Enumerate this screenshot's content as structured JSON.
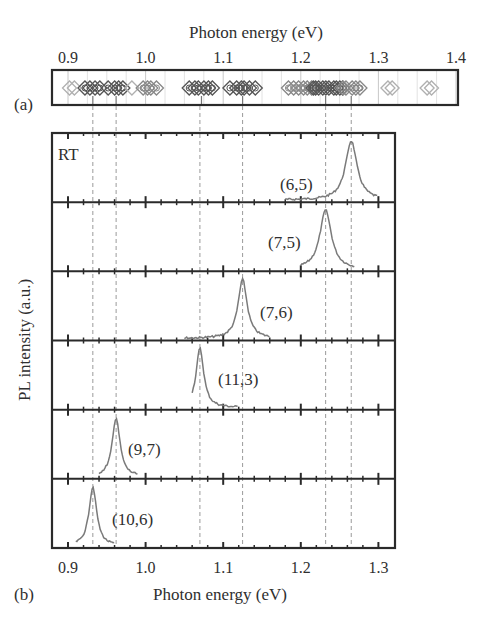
{
  "chart_data": [
    {
      "panel": "(a)",
      "type": "scatter",
      "title": "",
      "xlabel": "Photon energy (eV)",
      "xlabel_position": "top",
      "xlim": [
        0.9,
        1.4
      ],
      "xticks": [
        "0.9",
        "1.0",
        "1.1",
        "1.2",
        "1.3",
        "1.4"
      ],
      "marker": "open-diamond",
      "grid": "vertical minor lines",
      "clusters": [
        {
          "center": 0.905,
          "count": 2,
          "density": "light"
        },
        {
          "center": 0.932,
          "count": 4,
          "density": "dark"
        },
        {
          "center": 0.962,
          "count": 4,
          "density": "dark"
        },
        {
          "center": 0.983,
          "count": 1,
          "density": "light"
        },
        {
          "center": 1.005,
          "count": 4,
          "density": "medium"
        },
        {
          "center": 1.072,
          "count": 6,
          "density": "dark"
        },
        {
          "center": 1.125,
          "count": 6,
          "density": "dark"
        },
        {
          "center": 1.2,
          "count": 6,
          "density": "medium"
        },
        {
          "center": 1.235,
          "count": 10,
          "density": "dark"
        },
        {
          "center": 1.265,
          "count": 5,
          "density": "medium"
        },
        {
          "center": 1.315,
          "count": 2,
          "density": "light"
        },
        {
          "center": 1.365,
          "count": 2,
          "density": "light"
        }
      ],
      "arrows_at": [
        0.932,
        0.962,
        1.072,
        1.125,
        1.232,
        1.265
      ]
    },
    {
      "panel": "(b)",
      "type": "line",
      "title": "",
      "annotation": "RT",
      "xlabel": "Photon energy (eV)",
      "ylabel": "PL intensity (a.u.)",
      "xlim": [
        0.88,
        1.32
      ],
      "xticks": [
        "0.9",
        "1.0",
        "1.1",
        "1.2",
        "1.3"
      ],
      "stacked": true,
      "series": [
        {
          "name": "(6,5)",
          "peak": 1.265,
          "fwhm": 0.018,
          "noise_range": [
            1.18,
            1.3
          ]
        },
        {
          "name": "(7,5)",
          "peak": 1.232,
          "fwhm": 0.018,
          "noise_range": [
            1.2,
            1.27
          ]
        },
        {
          "name": "(7,6)",
          "peak": 1.125,
          "fwhm": 0.014,
          "noise_range": [
            1.05,
            1.16
          ]
        },
        {
          "name": "(11,3)",
          "peak": 1.07,
          "fwhm": 0.012,
          "noise_range": [
            1.06,
            1.12
          ]
        },
        {
          "name": "(9,7)",
          "peak": 0.962,
          "fwhm": 0.012,
          "noise_range": [
            0.94,
            0.99
          ]
        },
        {
          "name": "(10,6)",
          "peak": 0.932,
          "fwhm": 0.012,
          "noise_range": [
            0.91,
            0.96
          ]
        }
      ],
      "guide_lines_at": [
        0.932,
        0.962,
        1.07,
        1.125,
        1.232,
        1.265
      ]
    }
  ],
  "labels": {
    "panel_a": "(a)",
    "panel_b": "(b)",
    "top_axis_title": "Photon energy (eV)",
    "bottom_axis_title": "Photon energy (eV)",
    "y_axis_title": "PL intensity (a.u.)",
    "rt": "RT"
  },
  "colors": {
    "frame": "#2a2a2a",
    "curve": "#7a7a7a",
    "guide": "#9a9a9a",
    "marker_light": "#b0b0b0",
    "marker_dark": "#555555"
  }
}
